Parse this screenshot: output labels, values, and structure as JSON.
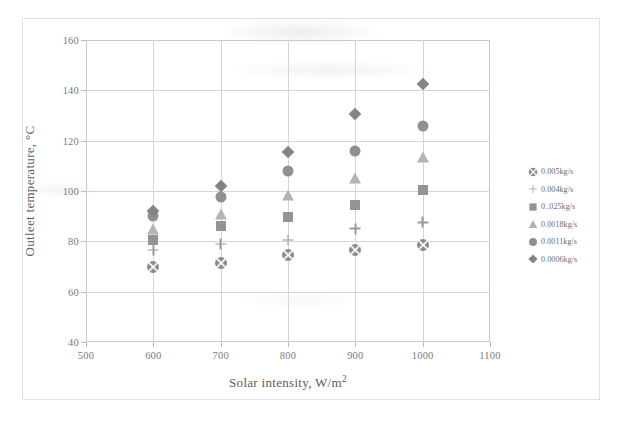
{
  "chart_data": {
    "type": "scatter",
    "title": "",
    "xlabel": "Solar intensity, W/m",
    "xlabel_sup": "2",
    "ylabel": "Outleet temperature, °C",
    "xlim": [
      500,
      1100
    ],
    "ylim": [
      40,
      160
    ],
    "xticks": [
      500,
      600,
      700,
      800,
      900,
      1000,
      1100
    ],
    "yticks": [
      40,
      60,
      80,
      100,
      120,
      140,
      160
    ],
    "grid": true,
    "legend_position": "right",
    "x": [
      600,
      700,
      800,
      900,
      1000
    ],
    "series": [
      {
        "name": "0.005kg/s",
        "marker": "circle-x",
        "color": "#8c8c8c",
        "values": [
          70.0,
          71.5,
          74.5,
          76.5,
          78.5
        ]
      },
      {
        "name": "0.004kg/s",
        "marker": "plus",
        "color": "#9a9a9a",
        "values": [
          76.5,
          79.0,
          80.5,
          85.0,
          87.5
        ]
      },
      {
        "name": "0..025kg/s",
        "marker": "square",
        "color": "#949494",
        "values": [
          80.5,
          86.0,
          89.5,
          94.5,
          100.5
        ]
      },
      {
        "name": "0.0018kg/s",
        "marker": "triangle",
        "color": "#b4b4b4",
        "values": [
          85.0,
          91.0,
          98.5,
          105.0,
          113.5
        ]
      },
      {
        "name": "0.0011kg/s",
        "marker": "circle",
        "color": "#909090",
        "values": [
          90.0,
          97.5,
          108.0,
          116.0,
          126.0
        ]
      },
      {
        "name": "0.0006kg/s",
        "marker": "diamond",
        "color": "#848484",
        "values": [
          92.0,
          102.0,
          115.5,
          130.5,
          142.5
        ]
      }
    ]
  },
  "legend": {
    "items": [
      {
        "label": "0.005kg/s"
      },
      {
        "label": "0.004kg/s"
      },
      {
        "label": "0..025kg/s"
      },
      {
        "label": "0.0018kg/s"
      },
      {
        "label": "0.0011kg/s"
      },
      {
        "label": "0.0006kg/s"
      }
    ]
  },
  "colors": {
    "grid": "#d5d5d5",
    "axis": "#c9c9c9",
    "frame": "#e2e2e2",
    "text": "#6f6f6f"
  }
}
